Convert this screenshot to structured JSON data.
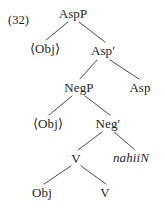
{
  "figure": {
    "example_number": "(32)",
    "language_item": "nahiiN",
    "diagram_type": "syntactic-tree"
  },
  "tree": {
    "nodes": [
      {
        "id": "aspp",
        "label": "AspP",
        "x": 73,
        "y": 13,
        "style": "roman"
      },
      {
        "id": "obj1",
        "label": "⟨Obj⟩",
        "x": 45,
        "y": 48,
        "style": "roman"
      },
      {
        "id": "aspbar",
        "label": "Asp′",
        "x": 103,
        "y": 50,
        "style": "roman"
      },
      {
        "id": "negp",
        "label": "NegP",
        "x": 79,
        "y": 87,
        "style": "roman"
      },
      {
        "id": "asp",
        "label": "Asp",
        "x": 140,
        "y": 87,
        "style": "roman"
      },
      {
        "id": "obj2",
        "label": "⟨Obj⟩",
        "x": 48,
        "y": 123,
        "style": "roman"
      },
      {
        "id": "negbar",
        "label": "Neg′",
        "x": 108,
        "y": 123,
        "style": "roman"
      },
      {
        "id": "v1",
        "label": "V",
        "x": 76,
        "y": 158,
        "style": "roman"
      },
      {
        "id": "nahiin",
        "label": "nahiiN",
        "x": 131,
        "y": 157,
        "style": "italic"
      },
      {
        "id": "obj3",
        "label": "Obj",
        "x": 42,
        "y": 192,
        "style": "roman"
      },
      {
        "id": "v2",
        "label": "V",
        "x": 105,
        "y": 192,
        "style": "roman"
      }
    ],
    "edges": [
      {
        "id": "aspp-obj1",
        "from": "aspp",
        "to": "obj1",
        "x1": 68,
        "y1": 22,
        "x2": 46,
        "y2": 40
      },
      {
        "id": "aspp-aspbar",
        "from": "aspp",
        "to": "aspbar",
        "x1": 79,
        "y1": 22,
        "x2": 105,
        "y2": 42
      },
      {
        "id": "aspbar-negp",
        "from": "aspbar",
        "to": "negp",
        "x1": 97,
        "y1": 60,
        "x2": 80,
        "y2": 79
      },
      {
        "id": "aspbar-asp",
        "from": "aspbar",
        "to": "asp",
        "x1": 110,
        "y1": 60,
        "x2": 139,
        "y2": 79
      },
      {
        "id": "negp-obj2",
        "from": "negp",
        "to": "obj2",
        "x1": 72,
        "y1": 96,
        "x2": 49,
        "y2": 115
      },
      {
        "id": "negp-negbar",
        "from": "negp",
        "to": "negbar",
        "x1": 85,
        "y1": 96,
        "x2": 110,
        "y2": 115
      },
      {
        "id": "negbar-v1",
        "from": "negbar",
        "to": "v1",
        "x1": 102,
        "y1": 132,
        "x2": 78,
        "y2": 150
      },
      {
        "id": "negbar-nahiin",
        "from": "negbar",
        "to": "nahiin",
        "x1": 114,
        "y1": 132,
        "x2": 134,
        "y2": 149
      },
      {
        "id": "v1-obj3",
        "from": "v1",
        "to": "obj3",
        "x1": 71,
        "y1": 166,
        "x2": 44,
        "y2": 184
      },
      {
        "id": "v1-v2",
        "from": "v1",
        "to": "v2",
        "x1": 81,
        "y1": 166,
        "x2": 106,
        "y2": 184
      }
    ]
  },
  "style": {
    "line_color": "#4a4a4a",
    "text_color": "#1e1e1e",
    "background": "#ffffff"
  },
  "label_position": {
    "x": 8,
    "y": 14
  }
}
